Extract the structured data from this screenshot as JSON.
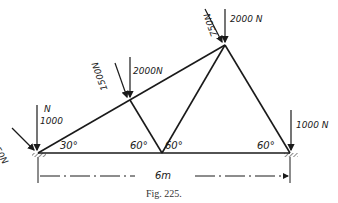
{
  "figure": {
    "caption": "Fig. 225.",
    "span_label": "6m",
    "angles": {
      "left_support": "30°",
      "middle_left": "60°",
      "middle_right": "60°",
      "right_support": "60°"
    },
    "loads": {
      "left_vertical": "1000",
      "left_vertical_unit": "N",
      "left_inclined": "750N",
      "upper_left_vertical": "2000N",
      "upper_left_inclined": "1500N",
      "top_vertical": "2000 N",
      "top_inclined": "750N",
      "right_vertical": "1000 N"
    },
    "colors": {
      "ink": "#1a1a1a",
      "background": "#ffffff"
    }
  }
}
